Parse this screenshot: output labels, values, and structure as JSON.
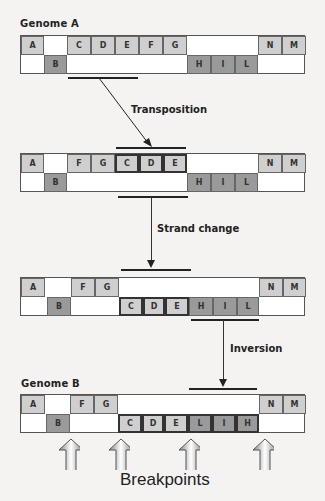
{
  "genome_a": {
    "label": "Genome A",
    "top_row": [
      {
        "text": "A",
        "x": 0,
        "w": 23,
        "shade": "light"
      },
      {
        "text": "C",
        "x": 46,
        "w": 24,
        "shade": "light"
      },
      {
        "text": "D",
        "x": 70,
        "w": 24,
        "shade": "light"
      },
      {
        "text": "E",
        "x": 94,
        "w": 24,
        "shade": "light"
      },
      {
        "text": "F",
        "x": 118,
        "w": 24,
        "shade": "light"
      },
      {
        "text": "G",
        "x": 142,
        "w": 24,
        "shade": "light"
      },
      {
        "text": "N",
        "x": 237,
        "w": 24,
        "shade": "light"
      },
      {
        "text": "M",
        "x": 261,
        "w": 24,
        "shade": "light"
      }
    ],
    "bottom_row": [
      {
        "text": "B",
        "x": 23,
        "w": 23,
        "shade": "dark"
      },
      {
        "text": "H",
        "x": 166,
        "w": 24,
        "shade": "dark"
      },
      {
        "text": "I",
        "x": 190,
        "w": 24,
        "shade": "dark"
      },
      {
        "text": "L",
        "x": 214,
        "w": 23,
        "shade": "dark"
      }
    ]
  },
  "step1": {
    "label": "Transposition"
  },
  "genome_2": {
    "top_row": [
      {
        "text": "A",
        "x": 0,
        "w": 23,
        "shade": "light"
      },
      {
        "text": "F",
        "x": 46,
        "w": 24,
        "shade": "light"
      },
      {
        "text": "G",
        "x": 70,
        "w": 24,
        "shade": "light"
      },
      {
        "text": "C",
        "x": 94,
        "w": 24,
        "shade": "light",
        "boxed": true
      },
      {
        "text": "D",
        "x": 118,
        "w": 24,
        "shade": "light",
        "boxed": true
      },
      {
        "text": "E",
        "x": 142,
        "w": 24,
        "shade": "light",
        "boxed": true
      },
      {
        "text": "N",
        "x": 237,
        "w": 24,
        "shade": "light"
      },
      {
        "text": "M",
        "x": 261,
        "w": 24,
        "shade": "light"
      }
    ],
    "bottom_row": [
      {
        "text": "B",
        "x": 23,
        "w": 23,
        "shade": "dark"
      },
      {
        "text": "H",
        "x": 166,
        "w": 24,
        "shade": "dark"
      },
      {
        "text": "I",
        "x": 190,
        "w": 24,
        "shade": "dark"
      },
      {
        "text": "L",
        "x": 214,
        "w": 23,
        "shade": "dark"
      }
    ]
  },
  "step2": {
    "label": "Strand change"
  },
  "genome_3": {
    "top_row": [
      {
        "text": "A",
        "x": 0,
        "w": 24,
        "shade": "light"
      },
      {
        "text": "F",
        "x": 50,
        "w": 24,
        "shade": "light"
      },
      {
        "text": "G",
        "x": 74,
        "w": 24,
        "shade": "light"
      },
      {
        "text": "N",
        "x": 238,
        "w": 24,
        "shade": "light"
      },
      {
        "text": "M",
        "x": 262,
        "w": 23,
        "shade": "light"
      }
    ],
    "bottom_row": [
      {
        "text": "B",
        "x": 26,
        "w": 24,
        "shade": "dark"
      },
      {
        "text": "C",
        "x": 98,
        "w": 24,
        "shade": "light",
        "boxed": true
      },
      {
        "text": "D",
        "x": 122,
        "w": 22,
        "shade": "light",
        "boxed": true
      },
      {
        "text": "E",
        "x": 144,
        "w": 24,
        "shade": "light",
        "boxed": true
      },
      {
        "text": "H",
        "x": 168,
        "w": 24,
        "shade": "dark"
      },
      {
        "text": "I",
        "x": 192,
        "w": 24,
        "shade": "dark"
      },
      {
        "text": "L",
        "x": 216,
        "w": 22,
        "shade": "dark"
      }
    ]
  },
  "step3": {
    "label": "Inversion"
  },
  "genome_b": {
    "label": "Genome B",
    "top_row": [
      {
        "text": "A",
        "x": 0,
        "w": 24,
        "shade": "light"
      },
      {
        "text": "F",
        "x": 49,
        "w": 24,
        "shade": "light"
      },
      {
        "text": "G",
        "x": 73,
        "w": 24,
        "shade": "light"
      },
      {
        "text": "N",
        "x": 238,
        "w": 24,
        "shade": "light"
      },
      {
        "text": "M",
        "x": 262,
        "w": 23,
        "shade": "light"
      }
    ],
    "bottom_row": [
      {
        "text": "B",
        "x": 25,
        "w": 24,
        "shade": "dark"
      },
      {
        "text": "C",
        "x": 97,
        "w": 24,
        "shade": "light",
        "boxed": true
      },
      {
        "text": "D",
        "x": 121,
        "w": 22,
        "shade": "light",
        "boxed": true
      },
      {
        "text": "E",
        "x": 143,
        "w": 24,
        "shade": "light",
        "boxed": true
      },
      {
        "text": "L",
        "x": 167,
        "w": 24,
        "shade": "dark",
        "boxed": true
      },
      {
        "text": "I",
        "x": 191,
        "w": 24,
        "shade": "dark",
        "boxed": true
      },
      {
        "text": "H",
        "x": 215,
        "w": 23,
        "shade": "dark",
        "boxed": true
      }
    ]
  },
  "breakpoints": {
    "label": "Breakpoints",
    "arrow_x": [
      58,
      108,
      178,
      252
    ]
  },
  "colors": {
    "light": "#cfcfcf",
    "dark": "#9a9a9a",
    "line": "#222222",
    "background": "#f4f3f1"
  }
}
